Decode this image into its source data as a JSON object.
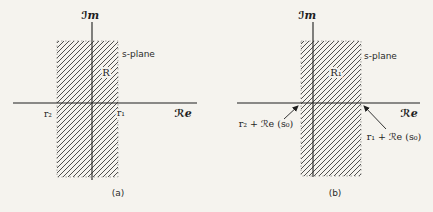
{
  "figure": {
    "background": "#f5f3ee",
    "ink": "#1e1e1e",
    "hatch_color": "#3b3b3b"
  },
  "diagrams": {
    "a": {
      "im_axis_label": "ℐm",
      "re_axis_label": "ℛe",
      "plane_label": "s-plane",
      "region_label": "R",
      "left_boundary_label": "r₂",
      "right_boundary_label": "r₁",
      "caption": "(a)"
    },
    "b": {
      "im_axis_label": "ℐm",
      "re_axis_label": "ℛe",
      "plane_label": "s-plane",
      "region_label": "R₁",
      "left_boundary_label": "r₂ + ℛe (s₀)",
      "right_boundary_label": "r₁ + ℛe (s₀)",
      "caption": "(b)"
    }
  }
}
